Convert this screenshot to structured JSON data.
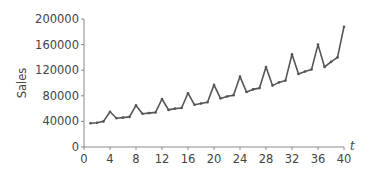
{
  "chart_data": {
    "type": "line",
    "title": "",
    "xlabel": "t",
    "ylabel": "Sales",
    "xlim": [
      0,
      40
    ],
    "ylim": [
      0,
      200000
    ],
    "grid": false,
    "legend": null,
    "x_ticks": [
      0,
      4,
      8,
      12,
      16,
      20,
      24,
      28,
      32,
      36,
      40
    ],
    "y_ticks": [
      0,
      40000,
      80000,
      120000,
      160000,
      200000
    ],
    "x_tick_labels": [
      "0",
      "4",
      "8",
      "12",
      "16",
      "20",
      "24",
      "28",
      "32",
      "36",
      "40"
    ],
    "y_tick_labels": [
      "0",
      "40000",
      "80000",
      "120000",
      "160000",
      "200000"
    ],
    "series": [
      {
        "name": "Sales",
        "color": "#555555",
        "x": [
          1,
          2,
          3,
          4,
          5,
          6,
          7,
          8,
          9,
          10,
          11,
          12,
          13,
          14,
          15,
          16,
          17,
          18,
          19,
          20,
          21,
          22,
          23,
          24,
          25,
          26,
          27,
          28,
          29,
          30,
          31,
          32,
          33,
          34,
          35,
          36,
          37,
          38,
          39,
          40
        ],
        "values": [
          37000,
          38000,
          40000,
          55000,
          45000,
          46000,
          47000,
          65000,
          52000,
          53000,
          54000,
          75000,
          58000,
          60000,
          61000,
          84000,
          66000,
          68000,
          70000,
          97000,
          76000,
          79000,
          81000,
          110000,
          86000,
          90000,
          92000,
          125000,
          96000,
          101000,
          104000,
          145000,
          114000,
          118000,
          121000,
          160000,
          125000,
          133000,
          140000,
          188000
        ]
      }
    ]
  }
}
